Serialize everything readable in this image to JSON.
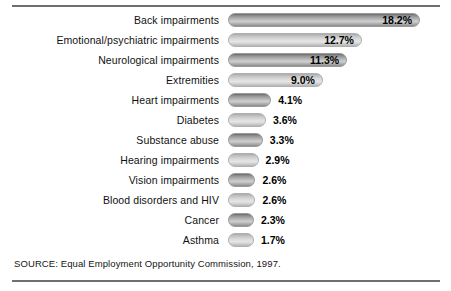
{
  "figure": {
    "source_note": "SOURCE: Equal Employment Opportunity Commission, 1997.",
    "accent_dark": "#6f6f6f",
    "bar_dark": "#8e8e8e",
    "bar_light": "#d2d2d2"
  },
  "chart_data": {
    "type": "bar",
    "orientation": "horizontal",
    "title": "",
    "subtitle": "",
    "xlabel": "",
    "ylabel": "",
    "xlim": [
      0,
      18.2
    ],
    "grid": false,
    "legend": null,
    "value_suffix": "%",
    "source": "SOURCE: Equal Employment Opportunity Commission, 1997.",
    "categories": [
      "Back impairments",
      "Emotional/psychiatric impairments",
      "Neurological impairments",
      "Extremities",
      "Heart impairments",
      "Diabetes",
      "Substance abuse",
      "Hearing impairments",
      "Vision impairments",
      "Blood disorders and HIV",
      "Cancer",
      "Asthma"
    ],
    "values": [
      18.2,
      12.7,
      11.3,
      9.0,
      4.1,
      3.6,
      3.3,
      2.9,
      2.6,
      2.6,
      2.3,
      1.7
    ],
    "labels": [
      "18.2%",
      "12.7%",
      "11.3%",
      "9.0%",
      "4.1%",
      "3.6%",
      "3.3%",
      "2.9%",
      "2.6%",
      "2.6%",
      "2.3%",
      "1.7%"
    ],
    "bar_shades": [
      "dark",
      "light",
      "dark",
      "light",
      "dark",
      "light",
      "dark",
      "light",
      "dark",
      "light",
      "dark",
      "light"
    ],
    "label_inside_bar": [
      true,
      true,
      true,
      true,
      false,
      false,
      false,
      false,
      false,
      false,
      false,
      false
    ]
  }
}
